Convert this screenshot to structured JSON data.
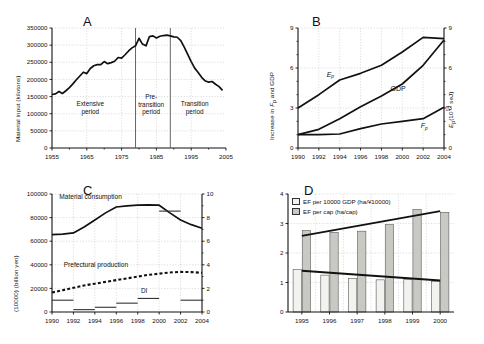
{
  "figure": {
    "background": "#ffffff",
    "line_color": "#111111",
    "grid_color": "#cccccc",
    "panels": [
      "A",
      "B",
      "C",
      "D"
    ]
  },
  "panelA": {
    "letter": "A",
    "ylabel": "Material input (kilotons)",
    "yticks": [
      "0",
      "50000",
      "100000",
      "150000",
      "200000",
      "250000",
      "300000",
      "350000"
    ],
    "ylim": [
      0,
      350000
    ],
    "xticks": [
      "1955",
      "1965",
      "1975",
      "1985",
      "1995",
      "2005"
    ],
    "xlim": [
      1955,
      2005
    ],
    "annotations": [
      {
        "name": "extensive-period",
        "lines": [
          "Extensive",
          "period"
        ],
        "x_center": 1966
      },
      {
        "name": "pre-transition-period",
        "lines": [
          "Pre-",
          "transition",
          "period"
        ],
        "x_center": 1983.5
      },
      {
        "name": "transition-period",
        "lines": [
          "Transition",
          "period"
        ],
        "x_center": 1996
      }
    ],
    "dividers": [
      1979,
      1989
    ],
    "chart_data": {
      "type": "line",
      "title": "Material input (kilotons)",
      "xlabel": "",
      "ylabel": "Material input (kilotons)",
      "xlim": [
        1955,
        2005
      ],
      "ylim": [
        0,
        350000
      ],
      "grid": true,
      "series": [
        {
          "name": "Material input",
          "x": [
            1955,
            1956,
            1957,
            1958,
            1959,
            1960,
            1961,
            1962,
            1963,
            1964,
            1965,
            1966,
            1967,
            1968,
            1969,
            1970,
            1971,
            1972,
            1973,
            1974,
            1975,
            1976,
            1977,
            1978,
            1979,
            1980,
            1981,
            1982,
            1983,
            1984,
            1985,
            1986,
            1987,
            1988,
            1989,
            1990,
            1991,
            1992,
            1993,
            1994,
            1995,
            1996,
            1997,
            1998,
            1999,
            2000,
            2001,
            2002,
            2003,
            2004
          ],
          "y": [
            156000,
            158000,
            165000,
            159000,
            167000,
            176000,
            187000,
            199000,
            210000,
            221000,
            217000,
            232000,
            240000,
            243000,
            243000,
            252000,
            246000,
            249000,
            253000,
            264000,
            262000,
            272000,
            283000,
            292000,
            298000,
            320000,
            303000,
            298000,
            325000,
            327000,
            321000,
            326000,
            328000,
            329000,
            327000,
            324000,
            323000,
            313000,
            294000,
            273000,
            252000,
            233000,
            220000,
            206000,
            196000,
            192000,
            194000,
            186000,
            179000,
            168000
          ]
        }
      ]
    }
  },
  "panelB": {
    "letter": "B",
    "ylabel_left": "Increase in Fp and GDP",
    "ylabel_right": "Ep (10^14 seJ)",
    "yticks_left": [
      "0",
      "3",
      "6",
      "9"
    ],
    "yticks_right": [
      "0",
      "3",
      "6",
      "9"
    ],
    "ylim": [
      0,
      9
    ],
    "xticks": [
      "1990",
      "1992",
      "1994",
      "1996",
      "1998",
      "2000",
      "2002",
      "2004"
    ],
    "xlim": [
      1990,
      2004
    ],
    "series_labels": [
      {
        "name": "label-ep",
        "text": "Ep"
      },
      {
        "name": "label-gdp",
        "text": "GDP"
      },
      {
        "name": "label-fp",
        "text": "Fp"
      }
    ],
    "chart_data": {
      "type": "line",
      "title": "",
      "xlabel": "",
      "ylabel": "Increase in Fp and GDP",
      "ylabel_right": "Ep (10^14 seJ)",
      "xlim": [
        1990,
        2004
      ],
      "ylim": [
        0,
        9
      ],
      "grid": true,
      "x": [
        1990,
        1992,
        1994,
        1996,
        1998,
        2000,
        2002,
        2004
      ],
      "series": [
        {
          "name": "Ep",
          "values": [
            3.0,
            4.0,
            5.1,
            5.6,
            6.2,
            7.2,
            8.3,
            8.2
          ]
        },
        {
          "name": "GDP",
          "values": [
            1.0,
            1.4,
            2.2,
            3.1,
            3.9,
            4.8,
            6.2,
            8.1
          ]
        },
        {
          "name": "Fp",
          "values": [
            1.0,
            1.0,
            1.05,
            1.45,
            1.8,
            2.0,
            2.2,
            3.05
          ]
        }
      ]
    }
  },
  "panelC": {
    "letter": "C",
    "ylabel_left": "(10000) (billion yen)",
    "yticks_left": [
      "0",
      "20000",
      "40000",
      "60000",
      "80000",
      "100000"
    ],
    "yticks_right": [
      "0",
      "2",
      "4",
      "6",
      "8",
      "10"
    ],
    "ylim_left": [
      0,
      100000
    ],
    "ylim_right": [
      0,
      10
    ],
    "xticks": [
      "1990",
      "1992",
      "1994",
      "1996",
      "1998",
      "2000",
      "2002",
      "2004"
    ],
    "xlim": [
      1990,
      2004
    ],
    "series_labels": [
      {
        "name": "label-material-consumption",
        "text": "Material consumption"
      },
      {
        "name": "label-prefectural-production",
        "text": "Prefectural production"
      },
      {
        "name": "label-di",
        "text": "DI"
      }
    ],
    "chart_data": {
      "type": "line",
      "title": "",
      "xlabel": "",
      "ylabel": "(10000) (billion yen)",
      "xlim": [
        1990,
        2004
      ],
      "ylim": [
        0,
        100000
      ],
      "grid": true,
      "x": [
        1990,
        1991,
        1992,
        1993,
        1994,
        1995,
        1996,
        1997,
        1998,
        1999,
        2000,
        2001,
        2002,
        2003,
        2004
      ],
      "series": [
        {
          "name": "Material consumption",
          "style": "solid",
          "values": [
            65500,
            66000,
            67000,
            72000,
            78000,
            84000,
            89000,
            90000,
            90500,
            90800,
            90500,
            84000,
            78000,
            74000,
            71000
          ]
        },
        {
          "name": "Prefectural production",
          "style": "dashed",
          "values": [
            16500,
            18500,
            20500,
            22500,
            24000,
            25500,
            27000,
            28500,
            30000,
            31500,
            32500,
            33500,
            34000,
            33800,
            33200
          ]
        }
      ],
      "di_steps": [
        {
          "x_start": 1990,
          "x_end": 1992,
          "value": 10000
        },
        {
          "x_start": 1992,
          "x_end": 1994,
          "value": 2000
        },
        {
          "x_start": 1994,
          "x_end": 1996,
          "value": 4000
        },
        {
          "x_start": 1996,
          "x_end": 1998,
          "value": 7500
        },
        {
          "x_start": 1998,
          "x_end": 2000,
          "value": 11500
        },
        {
          "x_start": 2000,
          "x_end": 2002,
          "value": 85500
        },
        {
          "x_start": 2002,
          "x_end": 2004,
          "value": 10000
        }
      ]
    }
  },
  "panelD": {
    "letter": "D",
    "yticks": [
      "0",
      "1",
      "2",
      "3",
      "4"
    ],
    "ylim": [
      0,
      4
    ],
    "xticks": [
      "1995",
      "1996",
      "1997",
      "1998",
      "1999",
      "2000"
    ],
    "legend": [
      {
        "name": "legend-ef-per-gdp",
        "label": "EF per 10000 GDP (ha/¥10000)",
        "color": "#f2f2ef"
      },
      {
        "name": "legend-ef-per-cap",
        "label": "EF per cap (ha/cap)",
        "color": "#c9c9c4"
      }
    ],
    "chart_data": {
      "type": "bar",
      "title": "",
      "xlabel": "",
      "ylabel": "",
      "ylim": [
        0,
        4
      ],
      "grid": true,
      "categories": [
        "1995",
        "1996",
        "1997",
        "1998",
        "1999",
        "2000"
      ],
      "series": [
        {
          "name": "EF per 10000 GDP (ha/¥10000)",
          "color": "#f2f2ef",
          "values": [
            1.44,
            1.25,
            1.14,
            1.09,
            1.11,
            1.04
          ]
        },
        {
          "name": "EF per cap (ha/cap)",
          "color": "#c9c9c4",
          "values": [
            2.76,
            2.7,
            2.74,
            2.96,
            3.48,
            3.38
          ]
        }
      ],
      "trendlines": [
        {
          "name": "trend-ef-per-cap",
          "y_start": 2.58,
          "y_end": 3.42
        },
        {
          "name": "trend-ef-per-gdp",
          "y_start": 1.4,
          "y_end": 1.07
        }
      ]
    }
  }
}
